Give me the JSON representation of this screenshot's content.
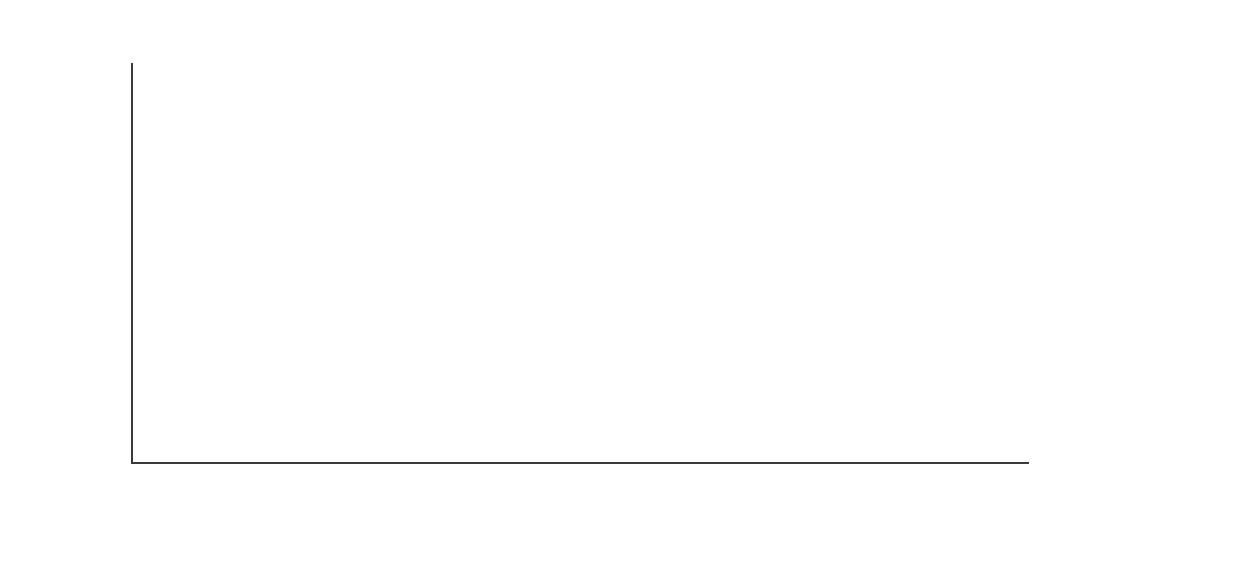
{
  "chart_data": {
    "type": "bar",
    "title": "",
    "subtitle": "",
    "xlabel": "Year",
    "ylabel": "",
    "categories": [
      "1841",
      "1851",
      "1861",
      "1871"
    ],
    "ylim": [
      0,
      100
    ],
    "ytick_labels": [
      "0%",
      "20%",
      "40%",
      "60%",
      "80%",
      "100%"
    ],
    "ytick_values": [
      0,
      20,
      40,
      60,
      80,
      100
    ],
    "grid": false,
    "legend_position": "top-right",
    "value_suffix": "%",
    "series": [
      {
        "name": "Agriculture, fishing and mining",
        "color": "#3b3b3b",
        "border": "#2a2a2a",
        "values": [
          0.2,
          0.8,
          0.3,
          0.2
        ]
      },
      {
        "name": "Dealing and transport",
        "color": "#c2c2c2",
        "border": "#c2c2c2",
        "values": [
          10.5,
          11.0,
          12.5,
          10.0
        ]
      },
      {
        "name": "Domestic service",
        "color": "#e3e3e3",
        "border": "#e3e3e3",
        "values": [
          45.5,
          45.0,
          42.0,
          38.5
        ]
      },
      {
        "name": "Manufacturing and building",
        "color": "#ffffff",
        "border": "#1f1f1f",
        "values": [
          40.0,
          40.0,
          42.0,
          45.0
        ]
      },
      {
        "name": "Public and professional",
        "color": "#b7b7b7",
        "border": "#1f1f1f",
        "values": [
          3.0,
          2.8,
          2.8,
          5.0
        ]
      }
    ]
  },
  "axes": {
    "y_ticks": [
      {
        "label": "100%",
        "value": 100
      },
      {
        "label": "80%",
        "value": 80
      },
      {
        "label": "60%",
        "value": 60
      },
      {
        "label": "40%",
        "value": 40
      },
      {
        "label": "20%",
        "value": 20
      },
      {
        "label": "0%",
        "value": 0
      }
    ],
    "x_ticks": [
      {
        "label": "1841"
      },
      {
        "label": "1851"
      },
      {
        "label": "1861"
      },
      {
        "label": "1871"
      }
    ],
    "x_title": "Year"
  },
  "legend": {
    "items": [
      {
        "label": "Agriculture, fishing and mining",
        "fill": "#3b3b3b",
        "stroke": "#2a2a2a"
      },
      {
        "label": "Dealing and transport",
        "fill": "#c8c8c8",
        "stroke": "#c8c8c8"
      },
      {
        "label": "Domestic service",
        "fill": "#e8e8e8",
        "stroke": "#e8e8e8"
      },
      {
        "label": "Manufacturing and building",
        "fill": "#ffffff",
        "stroke": "#1f1f1f"
      },
      {
        "label": "Public and professional",
        "fill": "#b7b7b7",
        "stroke": "#1f1f1f"
      }
    ]
  },
  "geometry": {
    "plot_left": 131,
    "plot_right": 1029,
    "baseline_y": 463,
    "top_y": 64,
    "group_centers": [
      237,
      461,
      685,
      909
    ],
    "bar_width": 44,
    "bar_gap": 1
  }
}
